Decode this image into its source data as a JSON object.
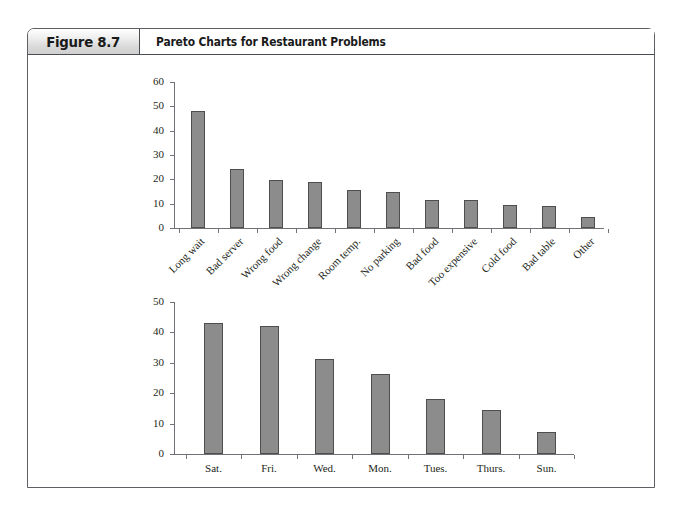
{
  "figure": {
    "number_label": "Figure 8.7",
    "title": "Pareto Charts for Restaurant Problems"
  },
  "style": {
    "bar_fill": "#8c8c8c",
    "bar_stroke": "#4e4e4e",
    "axis_color": "#6e7276",
    "text_color": "#231f20",
    "header_gradient_top": "#ffffff",
    "header_gradient_bottom": "#cfcfcf",
    "border_color": "#5c5f63"
  },
  "chart_data": [
    {
      "id": "restaurant-problems",
      "type": "bar",
      "title": "",
      "xlabel": "",
      "ylabel": "",
      "ylim": [
        0,
        60
      ],
      "yticks": [
        0,
        10,
        20,
        30,
        40,
        50,
        60
      ],
      "grid": false,
      "legend": "none",
      "label_rotation": -45,
      "categories": [
        "Long wait",
        "Bad server",
        "Wrong food",
        "Wrong change",
        "Room temp.",
        "No parking",
        "Bad food",
        "Too expensive",
        "Cold food",
        "Bad table",
        "Other"
      ],
      "values": [
        48,
        24.3,
        19.6,
        18.7,
        15.7,
        14.6,
        11.6,
        11.6,
        9.5,
        8.9,
        4.6
      ]
    },
    {
      "id": "problems-by-day",
      "type": "bar",
      "title": "",
      "xlabel": "",
      "ylabel": "",
      "ylim": [
        0,
        50
      ],
      "yticks": [
        0,
        10,
        20,
        30,
        40,
        50
      ],
      "grid": false,
      "legend": "none",
      "label_rotation": 0,
      "categories": [
        "Sat.",
        "Fri.",
        "Wed.",
        "Mon.",
        "Tues.",
        "Thurs.",
        "Sun."
      ],
      "values": [
        43.1,
        42.2,
        31.4,
        26.4,
        18.2,
        14.5,
        7.4
      ]
    }
  ]
}
